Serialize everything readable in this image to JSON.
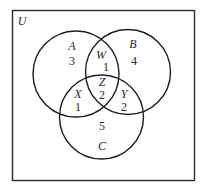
{
  "diagram": {
    "type": "venn",
    "universe_label": "U",
    "sets": [
      {
        "name": "A",
        "cx": 76,
        "cy": 74,
        "r": 43
      },
      {
        "name": "B",
        "cx": 128,
        "cy": 72,
        "r": 42.5
      },
      {
        "name": "C",
        "cx": 101.5,
        "cy": 117,
        "r": 42
      }
    ],
    "regions": [
      {
        "id": "A_only",
        "label": "A",
        "value": "3",
        "lx": 72,
        "ly": 46,
        "vx": 72,
        "vy": 61
      },
      {
        "id": "B_only",
        "label": "B",
        "value": "4",
        "lx": 133,
        "ly": 44,
        "vx": 134,
        "vy": 61
      },
      {
        "id": "A_and_B",
        "label": "W",
        "value": "1",
        "lx": 100,
        "ly": 55,
        "vx": 106,
        "vy": 68
      },
      {
        "id": "A_and_B_and_C",
        "label": "Z",
        "value": "2",
        "lx": 102,
        "ly": 82,
        "vx": 102,
        "vy": 96
      },
      {
        "id": "A_and_C",
        "label": "X",
        "value": "1",
        "lx": 78,
        "ly": 94,
        "vx": 78,
        "vy": 107
      },
      {
        "id": "B_and_C",
        "label": "Y",
        "value": "2",
        "lx": 124,
        "ly": 94,
        "vx": 124,
        "vy": 107
      },
      {
        "id": "C_only",
        "label": "C",
        "value": "5",
        "lx": 102,
        "ly": 146,
        "vx": 102,
        "vy": 126
      }
    ],
    "stroke_color": "#1e1e1e"
  }
}
